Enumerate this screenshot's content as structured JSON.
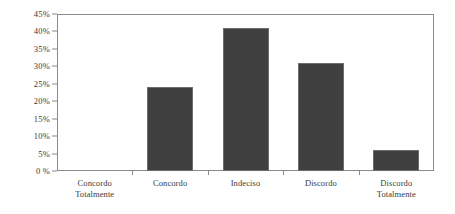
{
  "chart_data": {
    "type": "bar",
    "title": "",
    "xlabel": "",
    "ylabel": "",
    "categories": [
      "Concordo Totalmente",
      "Concordo",
      "Indeciso",
      "Discordo",
      "Discordo Totalmente"
    ],
    "category_lines": [
      [
        "Concordo",
        "Totalmente"
      ],
      [
        "Concordo"
      ],
      [
        "Indeciso"
      ],
      [
        "Discordo"
      ],
      [
        "Discordo",
        "Totalmente"
      ]
    ],
    "values": [
      0,
      24,
      41,
      31,
      6
    ],
    "value_labels": [
      "0%",
      "24%",
      "41%",
      "31%",
      "6%"
    ],
    "ylim": [
      0,
      45
    ],
    "ytick_values": [
      0,
      5,
      10,
      15,
      20,
      25,
      30,
      35,
      40,
      45
    ],
    "ytick_labels": [
      "0 %",
      "5%",
      "10%",
      "15%",
      "20%",
      "25%",
      "30%",
      "35%",
      "40%",
      "45%"
    ],
    "grid": false,
    "legend": null,
    "bar_color": "#404040",
    "bar_border_color": "#6d6d6d",
    "axis_color": "#8a8a8a",
    "text_color": "#3a3a3a",
    "background_color": "#ffffff"
  }
}
